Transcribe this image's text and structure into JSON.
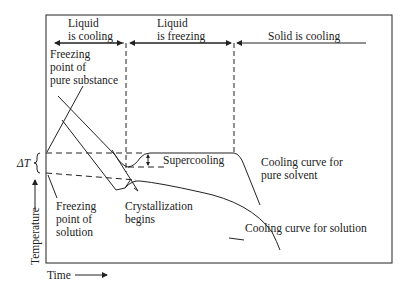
{
  "diagram": {
    "phases": {
      "liquid_cooling": [
        "Liquid",
        "is cooling"
      ],
      "liquid_freezing": [
        "Liquid",
        "is freezing"
      ],
      "solid_cooling": "Solid is cooling"
    },
    "annotations": {
      "fp_pure": [
        "Freezing",
        "point of",
        "pure substance"
      ],
      "fp_solution": [
        "Freezing",
        "point of",
        "solution"
      ],
      "crystallization": [
        "Crystallization",
        "begins"
      ],
      "supercooling": "Supercooling",
      "curve_pure": [
        "Cooling curve for",
        "pure solvent"
      ],
      "curve_solution": "Cooling curve for solution",
      "delta_t": "ΔT"
    },
    "axes": {
      "x_label": "Time",
      "y_label": "Temperature"
    },
    "line_color": "#222222"
  }
}
